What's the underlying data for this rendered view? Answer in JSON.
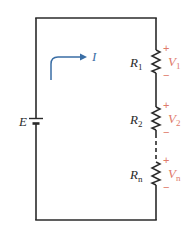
{
  "diagram": {
    "type": "series-circuit",
    "colors": {
      "wire": "#2a2a2a",
      "current": "#3a6ea5",
      "voltage": "#e07a6a"
    },
    "source": {
      "label": "E"
    },
    "current": {
      "label": "I"
    },
    "resistors": [
      {
        "label": "R",
        "sub": "1",
        "voltage_label": "V",
        "voltage_sub": "1",
        "plus": "+",
        "minus": "−"
      },
      {
        "label": "R",
        "sub": "2",
        "voltage_label": "V",
        "voltage_sub": "2",
        "plus": "+",
        "minus": "−"
      },
      {
        "label": "R",
        "sub": "n",
        "voltage_label": "V",
        "voltage_sub": "n",
        "plus": "+",
        "minus": "−"
      }
    ]
  }
}
